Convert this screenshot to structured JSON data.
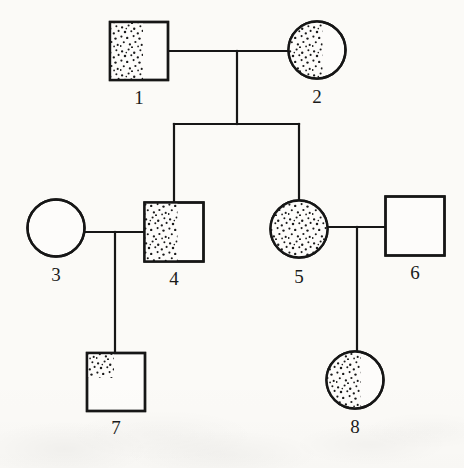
{
  "diagram": {
    "type": "pedigree",
    "background_color": "#fbfaf7",
    "line_color": "#161616",
    "stipple_color": "#1a1a1a",
    "generations": 3
  },
  "individuals": [
    {
      "id": "1",
      "label": "1",
      "sex": "male",
      "shape": "square",
      "fill_pattern": "stippled-left-partial",
      "fill_fraction": 0.57,
      "cx": 139,
      "cy": 51,
      "size": 58,
      "label_x": 139,
      "label_y": 100,
      "generation": 1
    },
    {
      "id": "2",
      "label": "2",
      "sex": "female",
      "shape": "circle",
      "fill_pattern": "stippled-left-partial",
      "fill_fraction": 0.6,
      "cx": 317,
      "cy": 50,
      "size": 57,
      "label_x": 317,
      "label_y": 99,
      "generation": 1
    },
    {
      "id": "3",
      "label": "3",
      "sex": "female",
      "shape": "circle",
      "fill_pattern": "empty",
      "fill_fraction": 0,
      "cx": 56,
      "cy": 228,
      "size": 57,
      "label_x": 56,
      "label_y": 277,
      "generation": 2
    },
    {
      "id": "4",
      "label": "4",
      "sex": "male",
      "shape": "square",
      "fill_pattern": "stippled-left-partial",
      "fill_fraction": 0.56,
      "cx": 174,
      "cy": 232,
      "size": 59,
      "label_x": 174,
      "label_y": 281,
      "generation": 2
    },
    {
      "id": "5",
      "label": "5",
      "sex": "female",
      "shape": "circle",
      "fill_pattern": "stippled-full",
      "fill_fraction": 1,
      "cx": 299,
      "cy": 229,
      "size": 57,
      "label_x": 299,
      "label_y": 279,
      "generation": 2
    },
    {
      "id": "6",
      "label": "6",
      "sex": "male",
      "shape": "square",
      "fill_pattern": "empty",
      "fill_fraction": 0,
      "cx": 415,
      "cy": 226,
      "size": 59,
      "label_x": 415,
      "label_y": 275,
      "generation": 2
    },
    {
      "id": "7",
      "label": "7",
      "sex": "male",
      "shape": "square",
      "fill_pattern": "stippled-upper-left-quadrant",
      "fill_fraction": 0.45,
      "cx": 116,
      "cy": 382,
      "size": 58,
      "label_x": 116,
      "label_y": 430,
      "generation": 3
    },
    {
      "id": "8",
      "label": "8",
      "sex": "female",
      "shape": "circle",
      "fill_pattern": "stippled-left-partial",
      "fill_fraction": 0.6,
      "cx": 355,
      "cy": 380,
      "size": 57,
      "label_x": 355,
      "label_y": 429,
      "generation": 3
    }
  ],
  "matings": [
    {
      "id": "m1",
      "partners": [
        "1",
        "2"
      ],
      "line_y": 51,
      "x_from": 168,
      "x_to": 289,
      "drop_x": 237
    },
    {
      "id": "m2",
      "partners": [
        "3",
        "4"
      ],
      "line_y": 232,
      "x_from": 84,
      "x_to": 145,
      "drop_x": 115
    },
    {
      "id": "m3",
      "partners": [
        "5",
        "6"
      ],
      "line_y": 227,
      "x_from": 327,
      "x_to": 386,
      "drop_x": 357
    }
  ],
  "sibships": [
    {
      "id": "s1",
      "parents": "m1",
      "bar_y": 124,
      "bar_x_from": 174,
      "bar_x_to": 299,
      "stem_from_y": 51,
      "children": [
        "4",
        "5"
      ]
    },
    {
      "id": "s2",
      "parents": "m2",
      "bar_y": 232,
      "bar_x_from": 115,
      "bar_x_to": 115,
      "stem_from_y": 232,
      "children": [
        "7"
      ]
    },
    {
      "id": "s3",
      "parents": "m3",
      "bar_y": 227,
      "bar_x_from": 357,
      "bar_x_to": 357,
      "stem_from_y": 227,
      "children": [
        "8"
      ]
    }
  ],
  "legend_text": ""
}
